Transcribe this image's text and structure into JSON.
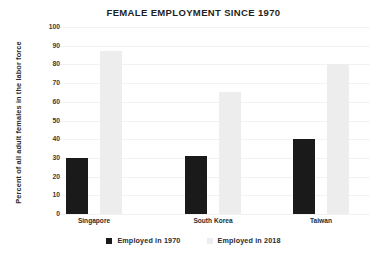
{
  "chart_data": {
    "type": "bar",
    "title": "FEMALE EMPLOYMENT SINCE 1970",
    "xlabel": "",
    "ylabel": "Percent of all adult females in the labor force",
    "categories": [
      "Singapore",
      "South Korea",
      "Taiwan"
    ],
    "series": [
      {
        "name": "Employed in 1970",
        "values": [
          30,
          31,
          40
        ],
        "color": "#1a1a1a"
      },
      {
        "name": "Employed in 2018",
        "values": [
          87,
          65,
          80
        ],
        "color": "#ededed"
      }
    ],
    "ylim": [
      0,
      100
    ],
    "ytick_labels": [
      "100",
      "90",
      "80",
      "70",
      "60",
      "50",
      "40",
      "30",
      "20",
      "10",
      "0"
    ],
    "ytick_values": [
      100,
      90,
      80,
      70,
      60,
      50,
      40,
      30,
      20,
      10,
      0
    ],
    "grid": true,
    "legend_position": "bottom"
  }
}
